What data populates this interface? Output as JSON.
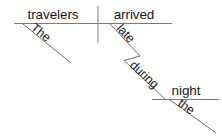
{
  "diagram": {
    "type": "reed-kellogg-sentence-diagram",
    "sentence": "The travelers arrived late during the night.",
    "canvas": {
      "width": 222,
      "height": 140
    },
    "colors": {
      "background": "#ffffff",
      "line": "#6e6e6e",
      "text": "#1a1a1a"
    },
    "words": {
      "subject": "travelers",
      "verb": "arrived",
      "subject_article": "The",
      "verb_modifier": "late",
      "preposition": "during",
      "object_of_preposition": "night",
      "object_article": "the"
    },
    "lines": {
      "baseline": {
        "x1": 14,
        "y1": 23.5,
        "x2": 172,
        "y2": 23.5
      },
      "subject_verb_divider": {
        "x1": 98,
        "y1": 6,
        "x2": 98,
        "y2": 43
      },
      "subject_article_slant": {
        "x1": 23,
        "y1": 24,
        "x2": 71,
        "y2": 63
      },
      "verb_modifier_slant": {
        "x1": 110,
        "y1": 24,
        "x2": 140,
        "y2": 56
      },
      "preposition_elbow": {
        "x1": 140,
        "y1": 56,
        "x2": 124,
        "y2": 60.5
      },
      "preposition_slant": {
        "x1": 124,
        "y1": 60.5,
        "x2": 166,
        "y2": 100
      },
      "object_baseline": {
        "x1": 152,
        "y1": 99.5,
        "x2": 219,
        "y2": 99.5
      },
      "object_article_slant": {
        "x1": 170,
        "y1": 100,
        "x2": 216,
        "y2": 133
      }
    },
    "labels": {
      "subject": {
        "x": 53,
        "y": 19,
        "rotate": 0,
        "anchor": "middle"
      },
      "verb": {
        "x": 134,
        "y": 19,
        "rotate": 0,
        "anchor": "middle"
      },
      "subject_article": {
        "x": 30,
        "y": 29,
        "rotate": 39,
        "anchor": "start"
      },
      "verb_modifier": {
        "x": 116,
        "y": 29,
        "rotate": 47,
        "anchor": "start"
      },
      "preposition": {
        "x": 129,
        "y": 66,
        "rotate": 43,
        "anchor": "start"
      },
      "object_of_preposition": {
        "x": 186,
        "y": 95,
        "rotate": 0,
        "anchor": "middle"
      },
      "object_article": {
        "x": 177,
        "y": 105,
        "rotate": 36,
        "anchor": "start"
      }
    }
  }
}
